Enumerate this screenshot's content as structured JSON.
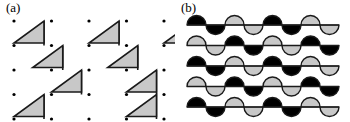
{
  "figure": {
    "width": 350,
    "height": 122,
    "background": "#ffffff",
    "panels": [
      {
        "id": "a",
        "label": "(a)",
        "description": "dot lattice with shaded right triangles in staircase chains"
      },
      {
        "id": "b",
        "label": "(b)",
        "description": "rows of semicircular wave lobes alternating black and gray"
      }
    ]
  },
  "colors": {
    "stroke": "#1a1a1a",
    "gray_fill": "#c8c8c8",
    "black_fill": "#000000",
    "dot": "#000000",
    "background": "#ffffff"
  },
  "panel_a": {
    "label": "(a)",
    "lattice": {
      "origin_x": 14,
      "origin_y": 21,
      "spacing_x": 37.5,
      "spacing_y": 24.5,
      "cols": 5,
      "rows": 5,
      "dot_radius": 1.6
    },
    "triangle": {
      "width": 30,
      "height": 22,
      "shape": "right-triangle-hypotenuse-bottom-left-to-top-right",
      "fill": "#c8c8c8",
      "stroke": "#1a1a1a",
      "stroke_width": 1.6
    },
    "chains": [
      {
        "start_col": 0,
        "start_row": 0,
        "steps": 3
      },
      {
        "start_col": 2,
        "start_row": 0,
        "steps": 3
      },
      {
        "start_col": 4,
        "start_row": 0,
        "steps": 2
      },
      {
        "start_col": 0,
        "start_row": 3,
        "steps": 2
      },
      {
        "start_col": 3,
        "start_row": 3,
        "steps": 2
      }
    ]
  },
  "panel_b": {
    "label": "(b)",
    "wave": {
      "origin_x": 12,
      "origin_y": 25,
      "row_spacing": 20.5,
      "rows": 5,
      "lobe_radius": 9.5,
      "lobes_per_row": 8,
      "stroke": "#1a1a1a",
      "stroke_width": 1.4
    },
    "row_patterns": [
      {
        "row": 0,
        "start_fill": "black",
        "sequence": [
          "black",
          "black",
          "gray",
          "gray",
          "black",
          "black",
          "gray",
          "gray"
        ]
      },
      {
        "row": 1,
        "start_fill": "gray",
        "sequence": [
          "gray",
          "gray",
          "black",
          "black",
          "gray",
          "gray",
          "black",
          "black"
        ]
      },
      {
        "row": 2,
        "start_fill": "black",
        "sequence": [
          "black",
          "black",
          "gray",
          "gray",
          "black",
          "black",
          "gray",
          "gray"
        ]
      },
      {
        "row": 3,
        "start_fill": "gray",
        "sequence": [
          "gray",
          "gray",
          "black",
          "black",
          "gray",
          "gray",
          "black",
          "black"
        ]
      },
      {
        "row": 4,
        "start_fill": "black",
        "sequence": [
          "black",
          "black",
          "gray",
          "gray",
          "black",
          "black",
          "gray",
          "gray"
        ]
      }
    ]
  }
}
